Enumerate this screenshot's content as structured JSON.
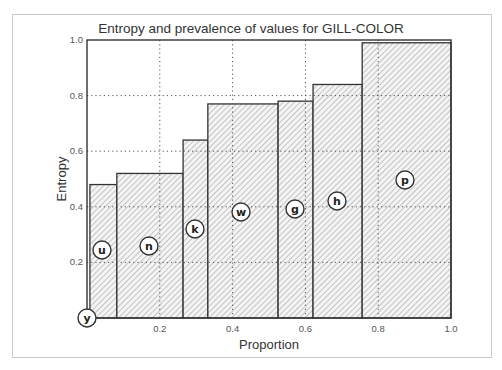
{
  "chart_data": {
    "type": "bar",
    "variant": "variable-width (mosaic) bar",
    "title": "Entropy and prevalence of values for GILL-COLOR",
    "xlabel": "Proportion",
    "ylabel": "Entropy",
    "xlim": [
      0.0,
      1.0
    ],
    "ylim": [
      0.0,
      1.0
    ],
    "xticks": [
      "0.0",
      "0.2",
      "0.4",
      "0.6",
      "0.8",
      "1.0"
    ],
    "yticks": [
      "0.2",
      "0.4",
      "0.6",
      "0.8",
      "1.0"
    ],
    "grid": true,
    "hatch": "diagonal",
    "categories": [
      "y",
      "u",
      "n",
      "k",
      "w",
      "g",
      "h",
      "p"
    ],
    "x_start": [
      0.0,
      0.008,
      0.082,
      0.264,
      0.332,
      0.525,
      0.621,
      0.756
    ],
    "x_end": [
      0.008,
      0.082,
      0.264,
      0.332,
      0.525,
      0.621,
      0.756,
      1.0
    ],
    "values": [
      0.0,
      0.48,
      0.52,
      0.64,
      0.77,
      0.78,
      0.84,
      0.99
    ],
    "labels": [
      {
        "text": "y",
        "cx": 87,
        "cy": 318
      },
      {
        "text": "u",
        "cx": 102,
        "cy": 250
      },
      {
        "text": "n",
        "cx": 149,
        "cy": 246
      },
      {
        "text": "k",
        "cx": 195,
        "cy": 229
      },
      {
        "text": "w",
        "cx": 241,
        "cy": 212
      },
      {
        "text": "g",
        "cx": 295,
        "cy": 209
      },
      {
        "text": "h",
        "cx": 337,
        "cy": 201
      },
      {
        "text": "p",
        "cx": 405,
        "cy": 180
      }
    ]
  },
  "layout": {
    "plot_left": 87,
    "plot_right": 451,
    "plot_top": 40,
    "plot_bottom": 318
  },
  "colors": {
    "bar_stroke": "#333333",
    "hatch": "#9a9a9a",
    "grid": "#555555",
    "frame": "#c8c8c8"
  }
}
